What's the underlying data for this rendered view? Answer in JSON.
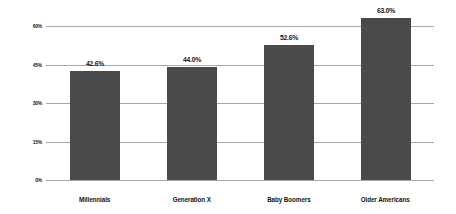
{
  "chart_data": {
    "type": "bar",
    "title": "",
    "subtitle": "",
    "xlabel": "",
    "ylabel": "",
    "categories": [
      "Millennials",
      "Generation X",
      "Baby Boomers",
      "Older Americans"
    ],
    "values": [
      42.6,
      44.0,
      52.6,
      63.0
    ],
    "value_labels": [
      "42.6%",
      "44.0%",
      "52.6%",
      "63.0%"
    ],
    "ylim": [
      0,
      60
    ],
    "y_ticks": [
      0,
      15,
      30,
      45,
      60
    ],
    "y_tick_labels": [
      "0%",
      "15%",
      "30%",
      "45%",
      "60%"
    ],
    "grid": true,
    "legend": false,
    "legend_position": "none",
    "bar_color": "#4a4a4a",
    "gridline_color": "#a8a8a8",
    "background_color": "#ffffff",
    "text_color": "#141414"
  }
}
